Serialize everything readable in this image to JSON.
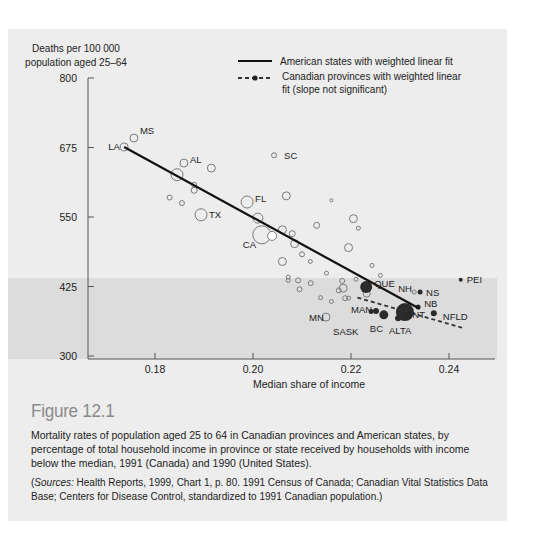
{
  "chart_data": {
    "type": "scatter",
    "title": "Figure 12.1",
    "ylabel": "Deaths per 100 000 population aged 25–64",
    "ylabel_lines": [
      "Deaths per 100 000",
      "population aged 25–64"
    ],
    "xlabel": "Median share of income",
    "xlim": [
      0.166,
      0.2465
    ],
    "ylim": [
      300,
      800
    ],
    "x_ticks": [
      0.18,
      0.2,
      0.22,
      0.24
    ],
    "x_tick_labels": [
      "0.18",
      "0.20",
      "0.22",
      "0.24"
    ],
    "y_ticks": [
      300,
      425,
      550,
      675,
      800
    ],
    "y_tick_labels": [
      "300",
      "425",
      "550",
      "675",
      "800"
    ],
    "grid": false,
    "shaded_band": {
      "y_from": 300,
      "y_to": 440
    },
    "legend": {
      "position": "top-right",
      "entries": [
        {
          "style": "solid",
          "lines": [
            "American states with weighted linear fit"
          ]
        },
        {
          "style": "dashed-dot",
          "lines": [
            "Canadian provinces with weighted linear",
            "fit (slope not significant)"
          ]
        }
      ]
    },
    "series": [
      {
        "name": "American states",
        "marker": "open-circle",
        "fit_line": {
          "x": [
            0.1737,
            0.234
          ],
          "y": [
            676,
            385
          ]
        },
        "points": [
          {
            "label": "LA",
            "x": 0.1737,
            "y": 676,
            "r": 4
          },
          {
            "label": "MS",
            "x": 0.1757,
            "y": 692,
            "r": 4
          },
          {
            "label": "AL",
            "x": 0.1859,
            "y": 647,
            "r": 4
          },
          {
            "label": "",
            "x": 0.1845,
            "y": 626,
            "r": 6
          },
          {
            "label": "",
            "x": 0.1915,
            "y": 638,
            "r": 4
          },
          {
            "label": "",
            "x": 0.188,
            "y": 608,
            "r": 2.5
          },
          {
            "label": "",
            "x": 0.188,
            "y": 598,
            "r": 3
          },
          {
            "label": "FL",
            "x": 0.1988,
            "y": 577,
            "r": 6
          },
          {
            "label": "TX",
            "x": 0.1894,
            "y": 554,
            "r": 6
          },
          {
            "label": "",
            "x": 0.1855,
            "y": 575,
            "r": 2.5
          },
          {
            "label": "",
            "x": 0.183,
            "y": 585,
            "r": 2.5
          },
          {
            "label": "SC",
            "x": 0.2043,
            "y": 661,
            "r": 2.5
          },
          {
            "label": "",
            "x": 0.2068,
            "y": 588,
            "r": 4
          },
          {
            "label": "",
            "x": 0.201,
            "y": 548,
            "r": 5
          },
          {
            "label": "CA",
            "x": 0.2018,
            "y": 518,
            "r": 9
          },
          {
            "label": "",
            "x": 0.2039,
            "y": 516,
            "r": 4.5,
            "fill": "white"
          },
          {
            "label": "",
            "x": 0.206,
            "y": 527,
            "r": 4
          },
          {
            "label": "",
            "x": 0.2085,
            "y": 502,
            "r": 4
          },
          {
            "label": "",
            "x": 0.208,
            "y": 520,
            "r": 3
          },
          {
            "label": "",
            "x": 0.213,
            "y": 535,
            "r": 3
          },
          {
            "label": "",
            "x": 0.2205,
            "y": 547,
            "r": 4
          },
          {
            "label": "",
            "x": 0.216,
            "y": 580,
            "r": 1.5
          },
          {
            "label": "",
            "x": 0.2215,
            "y": 530,
            "r": 2
          },
          {
            "label": "",
            "x": 0.2195,
            "y": 495,
            "r": 4
          },
          {
            "label": "",
            "x": 0.206,
            "y": 470,
            "r": 4
          },
          {
            "label": "",
            "x": 0.2117,
            "y": 470,
            "r": 2
          },
          {
            "label": "",
            "x": 0.21,
            "y": 483,
            "r": 2.5
          },
          {
            "label": "",
            "x": 0.221,
            "y": 438,
            "r": 2
          },
          {
            "label": "",
            "x": 0.2243,
            "y": 463,
            "r": 2
          },
          {
            "label": "",
            "x": 0.226,
            "y": 445,
            "r": 2
          },
          {
            "label": "",
            "x": 0.215,
            "y": 449,
            "r": 2
          },
          {
            "label": "",
            "x": 0.2072,
            "y": 442,
            "r": 2
          },
          {
            "label": "",
            "x": 0.2072,
            "y": 436,
            "r": 2
          },
          {
            "label": "",
            "x": 0.2092,
            "y": 436,
            "r": 2.5
          },
          {
            "label": "",
            "x": 0.2095,
            "y": 420,
            "r": 2.5
          },
          {
            "label": "",
            "x": 0.2118,
            "y": 431,
            "r": 2.5
          },
          {
            "label": "",
            "x": 0.2138,
            "y": 405,
            "r": 2
          },
          {
            "label": "",
            "x": 0.2175,
            "y": 418,
            "r": 2.5
          },
          {
            "label": "",
            "x": 0.2184,
            "y": 422,
            "r": 4
          },
          {
            "label": "",
            "x": 0.2182,
            "y": 435,
            "r": 2.5
          },
          {
            "label": "",
            "x": 0.216,
            "y": 398,
            "r": 2
          },
          {
            "label": "",
            "x": 0.2188,
            "y": 404,
            "r": 2.5
          },
          {
            "label": "",
            "x": 0.2195,
            "y": 404,
            "r": 2
          },
          {
            "label": "",
            "x": 0.2232,
            "y": 412,
            "r": 3.5
          },
          {
            "label": "MN",
            "x": 0.2149,
            "y": 370,
            "r": 4
          },
          {
            "label": "NH",
            "x": 0.2329,
            "y": 415,
            "r": 2
          }
        ]
      },
      {
        "name": "Canadian provinces",
        "marker": "filled-circle",
        "fit_line": {
          "x": [
            0.2213,
            0.243
          ],
          "y": [
            405,
            350
          ]
        },
        "points": [
          {
            "label": "QUE",
            "x": 0.2231,
            "y": 424,
            "r": 6
          },
          {
            "label": "ONT",
            "x": 0.231,
            "y": 379,
            "r": 9
          },
          {
            "label": "ALTA",
            "x": 0.2296,
            "y": 368,
            "r": 3
          },
          {
            "label": "BC",
            "x": 0.2267,
            "y": 374,
            "r": 4.5
          },
          {
            "label": "MAN",
            "x": 0.2251,
            "y": 381,
            "r": 3
          },
          {
            "label": "SASK",
            "x": 0.2241,
            "y": 380,
            "r": 2.5
          },
          {
            "label": "NS",
            "x": 0.2341,
            "y": 415,
            "r": 2.5
          },
          {
            "label": "NB",
            "x": 0.2337,
            "y": 388,
            "r": 2.5
          },
          {
            "label": "NFLD",
            "x": 0.2369,
            "y": 377,
            "r": 3
          },
          {
            "label": "PEI",
            "x": 0.2424,
            "y": 437,
            "r": 2
          }
        ]
      }
    ]
  },
  "caption": {
    "figure_title": "Figure 12.1",
    "text": "Mortality rates of population aged 25 to 64 in Canadian provinces and American states, by percentage of total household income in province or state received by households with income below the median, 1991 (Canada) and 1990 (United States).",
    "sources_label": "Sources:",
    "sources_text": " Health Reports, 1999, Chart 1, p. 80. 1991 Census of Canada; Canadian Vital Statistics Data Base; Centers for Disease Control, standardized to 1991 Canadian population.)",
    "sources_open": "("
  },
  "labels": {
    "LA": {
      "dx": -16,
      "dy": 3
    },
    "MS": {
      "dx": 6,
      "dy": -4
    },
    "AL": {
      "dx": 6,
      "dy": 0
    },
    "FL": {
      "dx": 8,
      "dy": 0
    },
    "TX": {
      "dx": 8,
      "dy": 3
    },
    "SC": {
      "dx": 10,
      "dy": 4
    },
    "CA": {
      "dx": -19,
      "dy": 13
    },
    "MN": {
      "dx": -17,
      "dy": 4
    },
    "NH": {
      "dx": -16,
      "dy": 0
    },
    "QUE": {
      "dx": 8,
      "dy": 0
    },
    "ONT": {
      "dx": 0,
      "dy": 6
    },
    "ALTA": {
      "dx": -9,
      "dy": 16
    },
    "BC": {
      "dx": -14,
      "dy": 17
    },
    "MAN": {
      "dx": -25,
      "dy": 2
    },
    "SASK": {
      "dx": -38,
      "dy": 23
    },
    "NS": {
      "dx": 6,
      "dy": 4
    },
    "NB": {
      "dx": 6,
      "dy": 0
    },
    "NFLD": {
      "dx": 9,
      "dy": 7
    },
    "PEI": {
      "dx": 6,
      "dy": 3
    }
  },
  "colors": {
    "panel_bg": "#ededed",
    "shaded_band": "#dcdcdc",
    "axis": "#555555",
    "text": "#222222",
    "open_marker": "#7a7a7a",
    "filled_marker": "#2b2b2b",
    "figure_title": "#8a8a8a"
  }
}
